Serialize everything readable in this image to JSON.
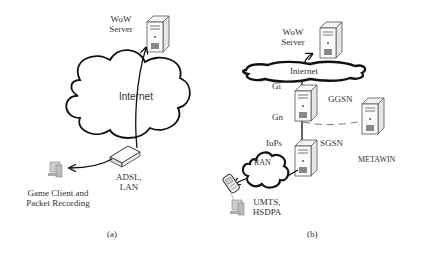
{
  "panel_a": {
    "server_label_line1": "WoW",
    "server_label_line2": "Server",
    "cloud_label": "Internet",
    "router_label_line1": "ADSL,",
    "router_label_line2": "LAN",
    "client_label_line1": "Game Client and",
    "client_label_line2": "Packet Recording",
    "caption": "(a)"
  },
  "panel_b": {
    "server_label_line1": "WoW",
    "server_label_line2": "Server",
    "cloud_label": "Internet",
    "gi_label": "Gi",
    "ggsn_label": "GGSN",
    "gn_label": "Gn",
    "iups_label": "IuPs",
    "sgsn_label": "SGSN",
    "ran_label": "RAN",
    "metawin_label": "METAWIN",
    "access_label_line1": "UMTS,",
    "access_label_line2": "HSDPA",
    "caption": "(b)"
  },
  "icons": {
    "server": "server-tower-icon",
    "router": "adsl-modem-icon",
    "client": "desktop-computer-icon",
    "phone": "mobile-phone-icon",
    "cloud": "cloud-icon"
  }
}
